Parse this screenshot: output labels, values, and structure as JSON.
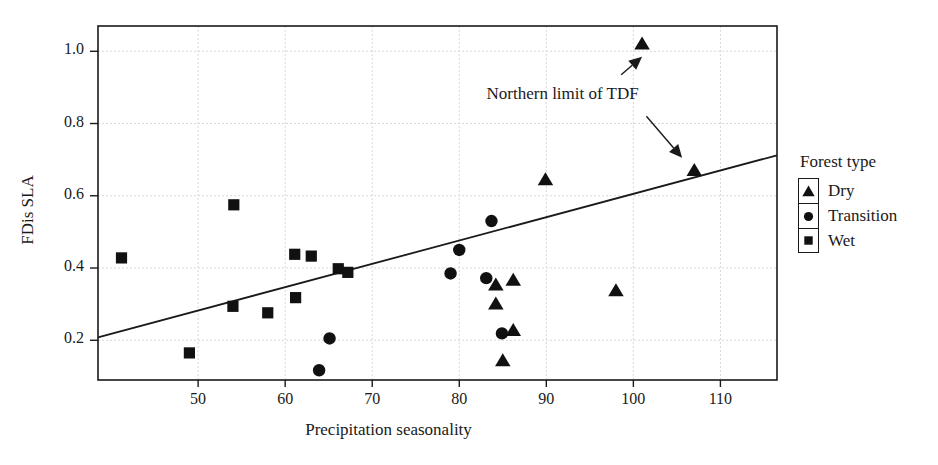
{
  "chart_data": {
    "type": "scatter",
    "title": "",
    "xlabel": "Precipitation seasonality",
    "ylabel": "FDis SLA",
    "xlim": [
      38.5,
      116.5
    ],
    "ylim": [
      0.09,
      1.07
    ],
    "xticks": [
      50,
      60,
      70,
      80,
      90,
      100,
      110
    ],
    "yticks": [
      0.2,
      0.4,
      0.6,
      0.8,
      1.0
    ],
    "ytick_labels": [
      "0.2",
      "0.4",
      "0.6",
      "0.8",
      "1.0"
    ],
    "xtick_labels": [
      "50",
      "60",
      "70",
      "80",
      "90",
      "100",
      "110"
    ],
    "grid": true,
    "legend": {
      "title": "Forest type",
      "position": "right",
      "entries": [
        {
          "label": "Dry",
          "marker": "triangle"
        },
        {
          "label": "Transition",
          "marker": "circle"
        },
        {
          "label": "Wet",
          "marker": "square"
        }
      ]
    },
    "annotations": [
      {
        "text": "Northern limit of TDF",
        "x": 96.0,
        "y": 0.875,
        "arrows": [
          {
            "from_x": 98.6,
            "from_y": 0.935,
            "to_x": 101.0,
            "to_y": 0.985
          },
          {
            "from_x": 101.5,
            "from_y": 0.82,
            "to_x": 105.6,
            "to_y": 0.705
          }
        ]
      }
    ],
    "trend_line": {
      "x": [
        38.5,
        116.5
      ],
      "y": [
        0.208,
        0.712
      ],
      "style": "solid",
      "color": "#1a1a1a"
    },
    "series": [
      {
        "name": "Dry",
        "marker": "triangle",
        "color": "#111111",
        "points": [
          {
            "x": 101.0,
            "y": 1.02
          },
          {
            "x": 107.0,
            "y": 0.67
          },
          {
            "x": 89.9,
            "y": 0.644
          },
          {
            "x": 98.0,
            "y": 0.337
          },
          {
            "x": 86.2,
            "y": 0.366
          },
          {
            "x": 84.2,
            "y": 0.353
          },
          {
            "x": 84.2,
            "y": 0.3
          },
          {
            "x": 86.2,
            "y": 0.227
          },
          {
            "x": 85.0,
            "y": 0.143
          }
        ]
      },
      {
        "name": "Transition",
        "marker": "circle",
        "color": "#111111",
        "points": [
          {
            "x": 83.7,
            "y": 0.53
          },
          {
            "x": 80.0,
            "y": 0.45
          },
          {
            "x": 79.0,
            "y": 0.385
          },
          {
            "x": 83.1,
            "y": 0.372
          },
          {
            "x": 84.9,
            "y": 0.219
          },
          {
            "x": 65.1,
            "y": 0.205
          },
          {
            "x": 63.9,
            "y": 0.117
          }
        ]
      },
      {
        "name": "Wet",
        "marker": "square",
        "color": "#111111",
        "points": [
          {
            "x": 54.1,
            "y": 0.575
          },
          {
            "x": 41.2,
            "y": 0.428
          },
          {
            "x": 61.1,
            "y": 0.438
          },
          {
            "x": 63.0,
            "y": 0.433
          },
          {
            "x": 66.1,
            "y": 0.398
          },
          {
            "x": 67.2,
            "y": 0.388
          },
          {
            "x": 61.2,
            "y": 0.318
          },
          {
            "x": 58.0,
            "y": 0.276
          },
          {
            "x": 54.0,
            "y": 0.294
          },
          {
            "x": 49.0,
            "y": 0.165
          }
        ]
      }
    ]
  }
}
